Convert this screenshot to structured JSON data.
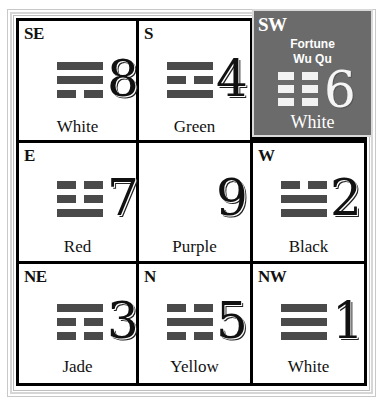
{
  "cells": {
    "se": {
      "direction": "SE",
      "number": "8",
      "color": "White",
      "trigram": [
        "full",
        "full",
        "broken"
      ]
    },
    "s": {
      "direction": "S",
      "number": "4",
      "color": "Green",
      "trigram": [
        "full",
        "broken",
        "full"
      ]
    },
    "sw": {
      "direction": "SW",
      "number": "6",
      "color": "White",
      "star_name": "Fortune",
      "star_sub": "Wu Qu",
      "trigram": [
        "broken",
        "broken",
        "broken"
      ],
      "highlight_bg": "#6b6b6b"
    },
    "e": {
      "direction": "E",
      "number": "7",
      "color": "Red",
      "trigram": [
        "broken",
        "broken",
        "full"
      ]
    },
    "c": {
      "direction": "",
      "number": "9",
      "color": "Purple"
    },
    "w": {
      "direction": "W",
      "number": "2",
      "color": "Black",
      "trigram": [
        "broken",
        "full",
        "full"
      ]
    },
    "ne": {
      "direction": "NE",
      "number": "3",
      "color": "Jade",
      "trigram": [
        "full",
        "broken",
        "broken"
      ]
    },
    "n": {
      "direction": "N",
      "number": "5",
      "color": "Yellow",
      "trigram": [
        "broken",
        "full",
        "broken"
      ]
    },
    "nw": {
      "direction": "NW",
      "number": "1",
      "color": "White",
      "trigram": [
        "full",
        "full",
        "full"
      ]
    }
  },
  "colors": {
    "grid_line": "#000000",
    "trigram_bar": "#4a4a4a",
    "highlight_cell": "#6b6b6b"
  }
}
